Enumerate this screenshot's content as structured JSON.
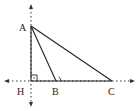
{
  "diagram": {
    "type": "geometry-triangle",
    "points": {
      "A": {
        "label": "A",
        "x": 31,
        "y": 26
      },
      "H": {
        "label": "H",
        "x": 31,
        "y": 81
      },
      "B": {
        "label": "B",
        "x": 56,
        "y": 81
      },
      "C": {
        "label": "C",
        "x": 112,
        "y": 81
      }
    },
    "segments": [
      "AH",
      "AB",
      "AC",
      "HC"
    ],
    "axes": {
      "vertical": {
        "x": 31,
        "y_from": 5,
        "y_to": 106,
        "style": "dotted",
        "arrows": "both"
      },
      "horizontal": {
        "y": 81,
        "x_from": 5,
        "x_to": 134,
        "style": "dotted",
        "arrows": "both"
      }
    },
    "marks": [
      {
        "type": "right-angle",
        "at": "H"
      },
      {
        "type": "angle-arc",
        "at": "B",
        "angle": "ABC"
      }
    ],
    "colors": {
      "line": "#222222",
      "background": "#ffffff"
    }
  }
}
